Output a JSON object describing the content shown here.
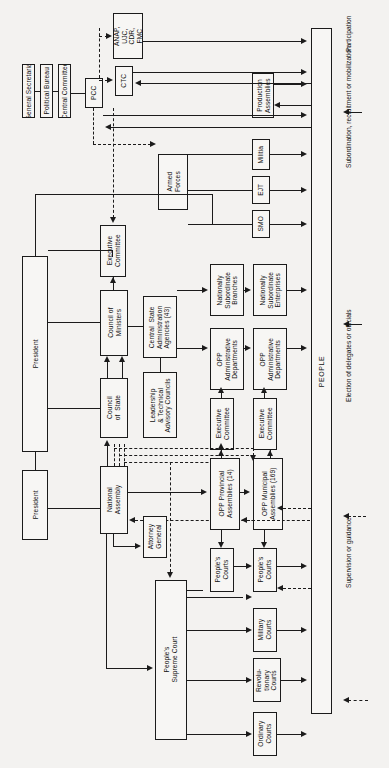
{
  "chart": {
    "orientation": "rotated-90",
    "people_column": "PEOPLE"
  },
  "party": {
    "general_secretariat": "General Secretariat",
    "political_bureau": "Political Bureau",
    "central_committee": "Central Committee",
    "pcc": "PCC"
  },
  "mass_orgs": {
    "anap": "ANAP,\nUJC,\nCDR,\nFMC",
    "ctc": "CTC",
    "production_assemblies": "Production\nAssemblies"
  },
  "military": {
    "armed_forces": "Armed\nForces",
    "militia": "Militia",
    "ejt": "EJT",
    "smo": "SMO"
  },
  "executive": {
    "president_top": "President",
    "president_bottom": "President",
    "executive_committee_top": "Executive\nCommittee",
    "council_of_ministers": "Council of\nMinisters",
    "council_of_state": "Council\nof  State",
    "central_state_agencies": "Central  State\nAdministration\nAgencies (43)",
    "leadership_councils": "Leadership\n& Technical\nAdvisory Councils"
  },
  "administration": {
    "nationally_subordinate_branches": "Nationally\nSubordinate\nBranches",
    "nationally_subordinate_enterprises": "Nationally\nSubordinate\nEnterprises",
    "opp_admin_departments_prov": "OPP\nAdministrative\nDepartments",
    "opp_admin_departments_mun": "OPP\nAdministrative\nDepartments",
    "executive_committee_prov": "Executive\nCommittee",
    "executive_committee_mun": "Executive\nCommittee"
  },
  "legislature": {
    "national_assembly": "National\nAssembly",
    "attorney_general": "Attorney\nGeneral",
    "opp_provincial_assemblies": "OPP Provincial\nAssemblies (14)",
    "opp_municipal_assemblies": "OPP Municipal\nAssemblies (169)"
  },
  "judiciary": {
    "peoples_supreme_court": "People's\nSupreme Court",
    "peoples_courts_prov": "People's\nCourts",
    "peoples_courts_mun": "People's\nCourts",
    "military_courts": "Military\nCourts",
    "revolutionary_courts": "Revolu-\ntionary\nCourts",
    "ordinary_courts": "Ordinary\nCourts"
  },
  "legend": {
    "participation": "Participation",
    "subordination": "Subordination, recruitment or mobilization",
    "election": "Election of delegates or officials",
    "supervision": "Supervision or guidance"
  },
  "colors": {
    "ink": "#1b1b1b",
    "paper": "#f3f2f0",
    "box_fill": "#f7f6f4"
  }
}
